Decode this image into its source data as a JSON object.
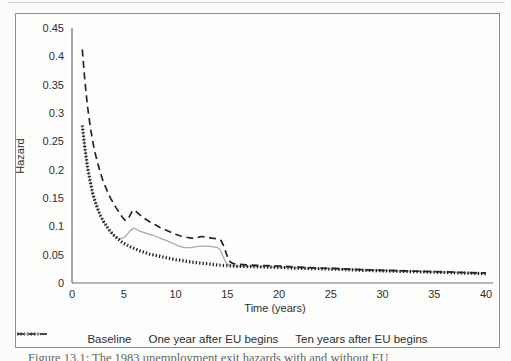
{
  "figure": {
    "caption_clipped": "Figure 13.1: The 1983 unemployment exit hazards with and without EU"
  },
  "chart_data": {
    "type": "line",
    "title": "",
    "xlabel": "Time (years)",
    "ylabel": "Hazard",
    "xlim": [
      0,
      40
    ],
    "ylim": [
      0,
      0.45
    ],
    "grid": false,
    "legend_position": "bottom",
    "axis_color": "#6e6e6a",
    "x_ticks": [
      {
        "v": 0,
        "label": "0"
      },
      {
        "v": 5,
        "label": "5"
      },
      {
        "v": 10,
        "label": "10"
      },
      {
        "v": 15,
        "label": "15"
      },
      {
        "v": 20,
        "label": "20"
      },
      {
        "v": 25,
        "label": "25"
      },
      {
        "v": 30,
        "label": "30"
      },
      {
        "v": 35,
        "label": "35"
      },
      {
        "v": 40,
        "label": "40"
      }
    ],
    "y_ticks": [
      {
        "v": 0,
        "label": "0"
      },
      {
        "v": 0.05,
        "label": "0.05"
      },
      {
        "v": 0.1,
        "label": "0.1"
      },
      {
        "v": 0.15,
        "label": "0.15"
      },
      {
        "v": 0.2,
        "label": "0.2"
      },
      {
        "v": 0.25,
        "label": "0.25"
      },
      {
        "v": 0.3,
        "label": "0.3"
      },
      {
        "v": 0.35,
        "label": "0.35"
      },
      {
        "v": 0.4,
        "label": "0.4"
      },
      {
        "v": 0.45,
        "label": "0.45"
      }
    ],
    "series": [
      {
        "name": "Baseline",
        "color": "#1c1c1a",
        "style": "dotted",
        "width": 3.2,
        "points": [
          [
            1,
            0.278
          ],
          [
            1.25,
            0.237
          ],
          [
            1.5,
            0.205
          ],
          [
            1.75,
            0.18
          ],
          [
            2,
            0.158
          ],
          [
            2.25,
            0.143
          ],
          [
            2.5,
            0.13
          ],
          [
            2.75,
            0.119
          ],
          [
            3,
            0.11
          ],
          [
            3.25,
            0.103
          ],
          [
            3.5,
            0.096
          ],
          [
            3.75,
            0.09
          ],
          [
            4,
            0.085
          ],
          [
            4.25,
            0.081
          ],
          [
            4.5,
            0.077
          ],
          [
            4.75,
            0.073
          ],
          [
            5,
            0.07
          ],
          [
            5.5,
            0.065
          ],
          [
            6,
            0.061
          ],
          [
            6.5,
            0.057
          ],
          [
            7,
            0.054
          ],
          [
            7.5,
            0.051
          ],
          [
            8,
            0.049
          ],
          [
            8.5,
            0.047
          ],
          [
            9,
            0.045
          ],
          [
            9.5,
            0.043
          ],
          [
            10,
            0.041
          ],
          [
            10.5,
            0.04
          ],
          [
            11,
            0.0385
          ],
          [
            11.5,
            0.037
          ],
          [
            12,
            0.036
          ],
          [
            12.5,
            0.035
          ],
          [
            13,
            0.034
          ],
          [
            13.5,
            0.033
          ],
          [
            14,
            0.032
          ],
          [
            14.5,
            0.031
          ],
          [
            15,
            0.0305
          ],
          [
            16,
            0.0295
          ],
          [
            17,
            0.029
          ],
          [
            18,
            0.0285
          ],
          [
            19,
            0.028
          ],
          [
            20,
            0.0275
          ],
          [
            22,
            0.026
          ],
          [
            24,
            0.025
          ],
          [
            26,
            0.024
          ],
          [
            28,
            0.0225
          ],
          [
            30,
            0.0215
          ],
          [
            32,
            0.0205
          ],
          [
            34,
            0.0195
          ],
          [
            36,
            0.0185
          ],
          [
            38,
            0.0175
          ],
          [
            40,
            0.0165
          ]
        ]
      },
      {
        "name": "One year after EU begins",
        "color": "#a9a9a5",
        "style": "solid",
        "width": 1.3,
        "points": [
          [
            1,
            0.276
          ],
          [
            1.5,
            0.204
          ],
          [
            2,
            0.157
          ],
          [
            2.5,
            0.129
          ],
          [
            3,
            0.109
          ],
          [
            3.5,
            0.0955
          ],
          [
            4,
            0.0845
          ],
          [
            4.3,
            0.0805
          ],
          [
            4.6,
            0.078
          ],
          [
            5,
            0.08
          ],
          [
            5.3,
            0.085
          ],
          [
            5.6,
            0.092
          ],
          [
            6,
            0.097
          ],
          [
            6.3,
            0.094
          ],
          [
            6.6,
            0.091
          ],
          [
            7,
            0.089
          ],
          [
            7.5,
            0.086
          ],
          [
            8,
            0.083
          ],
          [
            8.5,
            0.079
          ],
          [
            9,
            0.0755
          ],
          [
            9.5,
            0.072
          ],
          [
            10,
            0.068
          ],
          [
            10.3,
            0.0655
          ],
          [
            10.6,
            0.0635
          ],
          [
            11,
            0.0625
          ],
          [
            11.5,
            0.0625
          ],
          [
            12,
            0.064
          ],
          [
            12.5,
            0.065
          ],
          [
            13,
            0.065
          ],
          [
            13.5,
            0.064
          ],
          [
            14,
            0.063
          ],
          [
            14.3,
            0.0595
          ],
          [
            14.6,
            0.047
          ],
          [
            14.9,
            0.035
          ],
          [
            15.2,
            0.0315
          ],
          [
            15.5,
            0.0305
          ],
          [
            16,
            0.03
          ],
          [
            17,
            0.0295
          ],
          [
            18,
            0.029
          ],
          [
            19,
            0.0285
          ],
          [
            20,
            0.028
          ],
          [
            22,
            0.0265
          ],
          [
            24,
            0.0255
          ],
          [
            26,
            0.0245
          ],
          [
            28,
            0.023
          ],
          [
            30,
            0.022
          ],
          [
            32,
            0.021
          ],
          [
            34,
            0.02
          ],
          [
            36,
            0.019
          ],
          [
            38,
            0.018
          ],
          [
            40,
            0.017
          ]
        ]
      },
      {
        "name": "Ten years after EU begins",
        "color": "#262624",
        "style": "dashed",
        "width": 1.7,
        "points": [
          [
            1,
            0.412
          ],
          [
            1.25,
            0.356
          ],
          [
            1.5,
            0.312
          ],
          [
            1.75,
            0.278
          ],
          [
            2,
            0.25
          ],
          [
            2.25,
            0.228
          ],
          [
            2.5,
            0.21
          ],
          [
            2.75,
            0.194
          ],
          [
            3,
            0.18
          ],
          [
            3.25,
            0.169
          ],
          [
            3.5,
            0.158
          ],
          [
            3.75,
            0.149
          ],
          [
            4,
            0.141
          ],
          [
            4.25,
            0.133
          ],
          [
            4.5,
            0.126
          ],
          [
            4.75,
            0.119
          ],
          [
            5,
            0.113
          ],
          [
            5.2,
            0.11
          ],
          [
            5.5,
            0.116
          ],
          [
            5.8,
            0.126
          ],
          [
            6,
            0.129
          ],
          [
            6.2,
            0.126
          ],
          [
            6.5,
            0.121
          ],
          [
            7,
            0.114
          ],
          [
            7.5,
            0.108
          ],
          [
            8,
            0.103
          ],
          [
            8.5,
            0.098
          ],
          [
            9,
            0.094
          ],
          [
            9.5,
            0.09
          ],
          [
            10,
            0.086
          ],
          [
            10.5,
            0.083
          ],
          [
            11,
            0.081
          ],
          [
            11.5,
            0.079
          ],
          [
            12,
            0.08
          ],
          [
            12.5,
            0.082
          ],
          [
            13,
            0.081
          ],
          [
            13.5,
            0.079
          ],
          [
            14,
            0.078
          ],
          [
            14.4,
            0.075
          ],
          [
            14.7,
            0.064
          ],
          [
            15,
            0.047
          ],
          [
            15.3,
            0.037
          ],
          [
            15.6,
            0.034
          ],
          [
            16,
            0.033
          ],
          [
            17,
            0.032
          ],
          [
            18,
            0.031
          ],
          [
            19,
            0.0305
          ],
          [
            20,
            0.03
          ],
          [
            22,
            0.028
          ],
          [
            24,
            0.0265
          ],
          [
            26,
            0.025
          ],
          [
            28,
            0.0235
          ],
          [
            30,
            0.0225
          ],
          [
            32,
            0.0215
          ],
          [
            34,
            0.0205
          ],
          [
            36,
            0.0195
          ],
          [
            38,
            0.0185
          ],
          [
            40,
            0.0175
          ]
        ]
      }
    ]
  }
}
